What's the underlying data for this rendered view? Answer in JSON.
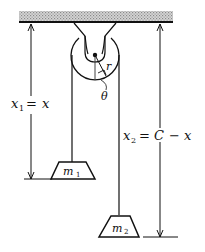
{
  "diagram": {
    "type": "atwood-machine",
    "ceiling": {
      "label": ""
    },
    "pulley": {
      "radius_label": "r",
      "angle_label": "θ"
    },
    "left_length": {
      "var": "x",
      "sub": "1",
      "eq": "=",
      "rhs": "x"
    },
    "right_length": {
      "var": "x",
      "sub": "2",
      "eq": "=",
      "rhs_c": "C",
      "minus": "−",
      "rhs_x": "x"
    },
    "mass1": {
      "var": "m",
      "sub": "1"
    },
    "mass2": {
      "var": "m",
      "sub": "2"
    },
    "colors": {
      "ink": "#111111",
      "ceiling_fill": "#bdbdbd",
      "background": "#ffffff"
    }
  }
}
